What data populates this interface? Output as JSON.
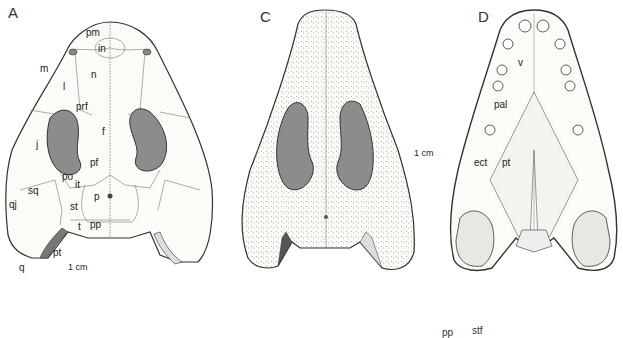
{
  "figure": {
    "panels": [
      {
        "id": "A",
        "letter": "A",
        "view": "dorsal, labelled",
        "labels": {
          "pm": "pm",
          "in": "in",
          "m": "m",
          "n": "n",
          "l": "l",
          "prf": "prf",
          "f": "f",
          "j": "j",
          "pf": "pf",
          "po": "po",
          "it": "it",
          "sq": "sq",
          "p": "p",
          "qj": "qj",
          "st": "st",
          "t": "t",
          "pp": "pp",
          "pt": "pt",
          "q": "q"
        },
        "scale_bar": "1 cm"
      },
      {
        "id": "C",
        "letter": "C",
        "view": "dorsal, stippled",
        "scale_bar": "1 cm"
      },
      {
        "id": "D",
        "letter": "D",
        "view": "palatal",
        "labels": {
          "v": "v",
          "pal": "pal",
          "ect": "ect",
          "pt": "pt"
        }
      }
    ],
    "cropped_bottom_labels": [
      "pp",
      "stf"
    ],
    "colors": {
      "orbit_fill": "#8c8c8c",
      "outline": "#333333",
      "background": "#ffffff"
    }
  }
}
